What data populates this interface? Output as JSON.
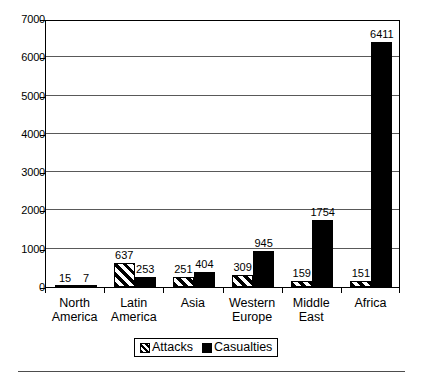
{
  "chart_data": {
    "type": "bar",
    "title": "",
    "subtitle": "",
    "xlabel": "",
    "ylabel": "",
    "categories": [
      "North America",
      "Latin America",
      "Asia",
      "Western Europe",
      "Middle East",
      "Africa"
    ],
    "category_lines": [
      [
        "North",
        "America"
      ],
      [
        "Latin",
        "America"
      ],
      [
        "Asia",
        ""
      ],
      [
        "Western",
        "Europe"
      ],
      [
        "Middle",
        "East"
      ],
      [
        "Africa",
        ""
      ]
    ],
    "series": [
      {
        "name": "Attacks",
        "pattern": "diagonal-hatch",
        "color": "#000000",
        "values": [
          15,
          637,
          251,
          309,
          159,
          151
        ]
      },
      {
        "name": "Casualties",
        "pattern": "solid",
        "color": "#000000",
        "values": [
          7,
          253,
          404,
          945,
          1754,
          6411
        ]
      }
    ],
    "ylim": [
      0,
      7000
    ],
    "ytick_values": [
      0,
      1000,
      2000,
      3000,
      4000,
      5000,
      6000,
      7000
    ],
    "ytick_labels": [
      "0",
      "1000",
      "2000",
      "3000",
      "4000",
      "5000",
      "6000",
      "7000"
    ],
    "grid": true,
    "grid_axis": "y",
    "data_labels": true,
    "legend": {
      "position": "bottom",
      "entries": [
        "Attacks",
        "Casualties"
      ]
    }
  }
}
